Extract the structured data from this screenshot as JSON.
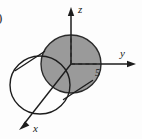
{
  "figure": {
    "background_color": "#fdfdfd",
    "stroke_color": "#1d1d1d",
    "shaded_fill_color": "#9a9a9a",
    "shaded_edge_color": "#2a2a2a",
    "corner_mark": ")"
  },
  "axes": {
    "z": {
      "label": "z",
      "direction": "up"
    },
    "y": {
      "label": "y",
      "direction": "right"
    },
    "x": {
      "label": "x",
      "direction": "down-left"
    }
  },
  "ticks": [
    {
      "axis": "y",
      "label": "5",
      "value": 5
    }
  ],
  "shapes": [
    {
      "name": "back-disk",
      "type": "ellipse",
      "filled": true,
      "fill": "#9a9a9a"
    },
    {
      "name": "front-circle",
      "type": "ellipse",
      "filled": false
    },
    {
      "name": "cylinder-wall-upper",
      "type": "line",
      "filled": false
    },
    {
      "name": "cylinder-wall-lower",
      "type": "line",
      "filled": false
    },
    {
      "name": "z-axis-dashed-radius",
      "type": "dashed-line"
    },
    {
      "name": "y-axis-dashed-radius",
      "type": "dashed-line"
    }
  ]
}
